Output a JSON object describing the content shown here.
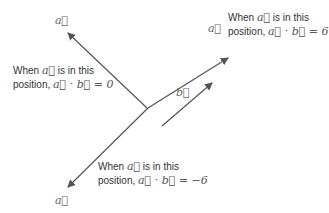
{
  "diagram": {
    "vector_labels": {
      "a_upper_left": "a⃗",
      "a_upper_right": "a⃗",
      "a_lower_left": "a⃗",
      "b": "b⃗"
    },
    "annotations": [
      {
        "line1_prefix": "When",
        "line1_vec": "a⃗",
        "line1_suffix": "is in this",
        "line2_prefix": "position,",
        "line2_expr": "a⃗ · b⃗ = 0"
      },
      {
        "line1_prefix": "When",
        "line1_vec": "a⃗",
        "line1_suffix": "is in this",
        "line2_prefix": "position,",
        "line2_expr": "a⃗ · b⃗ = 6"
      },
      {
        "line1_prefix": "When",
        "line1_vec": "a⃗",
        "line1_suffix": "is in this",
        "line2_prefix": "position,",
        "line2_expr": "a⃗ · b⃗ = −6"
      }
    ],
    "colors": {
      "arrow": "#555555",
      "text": "#333333"
    }
  }
}
